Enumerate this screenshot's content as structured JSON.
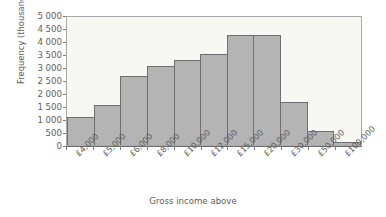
{
  "chart_data": {
    "type": "bar",
    "title": "",
    "subtitle": "",
    "xlabel": "Gross income above",
    "ylabel": "Frequency (thousands)",
    "categories": [
      "£4,000",
      "£5,000",
      "£6,000",
      "£8,000",
      "£10,000",
      "£12,000",
      "£15,000",
      "£20,000",
      "£30,000",
      "£50,000",
      "£100,000"
    ],
    "values": [
      1070,
      1530,
      2650,
      3050,
      3280,
      3500,
      4230,
      4230,
      1660,
      520,
      130
    ],
    "ylim": [
      0,
      5000
    ],
    "ytick_values": [
      0,
      500,
      1000,
      1500,
      2000,
      2500,
      3000,
      3500,
      4000,
      4500,
      5000
    ],
    "ytick_labels": [
      "0",
      "500",
      "1 000",
      "1 500",
      "2 000",
      "2 500",
      "3 000",
      "3 500",
      "4 000",
      "4 500",
      "5 000"
    ],
    "grid": false,
    "legend": null,
    "legend_position": "none",
    "bar_fill_color": "#b4b4b4",
    "bar_edge_color": "#6f6f6f",
    "plot_background_color": "#f7f7f4",
    "text_color": "#5d5d5d",
    "axis_color": "#7d7d7d"
  }
}
